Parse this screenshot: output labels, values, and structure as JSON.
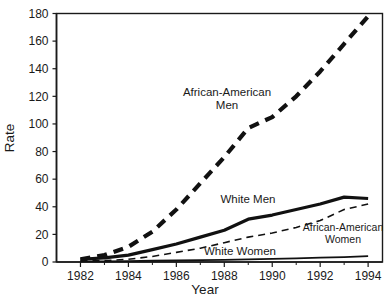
{
  "chart_data": {
    "type": "line",
    "title": "",
    "xlabel": "Year",
    "ylabel": "Rate",
    "xlim": [
      1981,
      1994.6
    ],
    "ylim": [
      0,
      180
    ],
    "grid": false,
    "legend_position": "inline-annotations",
    "x": [
      1982,
      1983,
      1984,
      1985,
      1986,
      1987,
      1988,
      1989,
      1990,
      1991,
      1992,
      1993,
      1994
    ],
    "xticks": [
      1982,
      1984,
      1986,
      1988,
      1990,
      1992,
      1994
    ],
    "xtick_labels": [
      "1982",
      "1984",
      "1986",
      "1988",
      "1990",
      "1992",
      "1994"
    ],
    "yticks": [
      0,
      20,
      40,
      60,
      80,
      100,
      120,
      140,
      160,
      180
    ],
    "ytick_labels": [
      "0",
      "20",
      "40",
      "60",
      "80",
      "100",
      "120",
      "140",
      "160",
      "180"
    ],
    "series": [
      {
        "name": "African-American Men",
        "style": "dashed",
        "width": 4.2,
        "label_lines": [
          "African-American",
          "Men"
        ],
        "values": [
          2,
          5,
          11,
          22,
          38,
          57,
          76,
          97,
          105,
          120,
          138,
          158,
          178
        ]
      },
      {
        "name": "White Men",
        "style": "solid",
        "width": 3.2,
        "label_lines": [
          "White Men"
        ],
        "values": [
          2,
          3,
          5,
          9,
          13,
          18,
          23,
          31,
          34,
          38,
          42,
          47,
          46
        ]
      },
      {
        "name": "African-American Women",
        "style": "dashed",
        "width": 1.6,
        "label_lines": [
          "African-American",
          "Women"
        ],
        "values": [
          1,
          1,
          2,
          4,
          7,
          10,
          14,
          18,
          21,
          25,
          30,
          38,
          42
        ]
      },
      {
        "name": "White Women",
        "style": "solid",
        "width": 1.8,
        "label_lines": [
          "White Women"
        ],
        "values": [
          0.4,
          0.5,
          0.7,
          0.9,
          1.1,
          1.3,
          1.6,
          1.9,
          2.2,
          2.6,
          3.1,
          3.6,
          4.2
        ]
      }
    ],
    "colors": {
      "line": "#111111",
      "axis": "#1a1a1a",
      "background": "#ffffff"
    }
  },
  "annotations": {
    "aa_men_line1": "African-American",
    "aa_men_line2": "Men",
    "white_men": "White Men",
    "aa_women_line1": "African-American",
    "aa_women_line2": "Women",
    "white_women": "White Women"
  },
  "axes": {
    "y_title": "Rate",
    "x_title": "Year"
  }
}
